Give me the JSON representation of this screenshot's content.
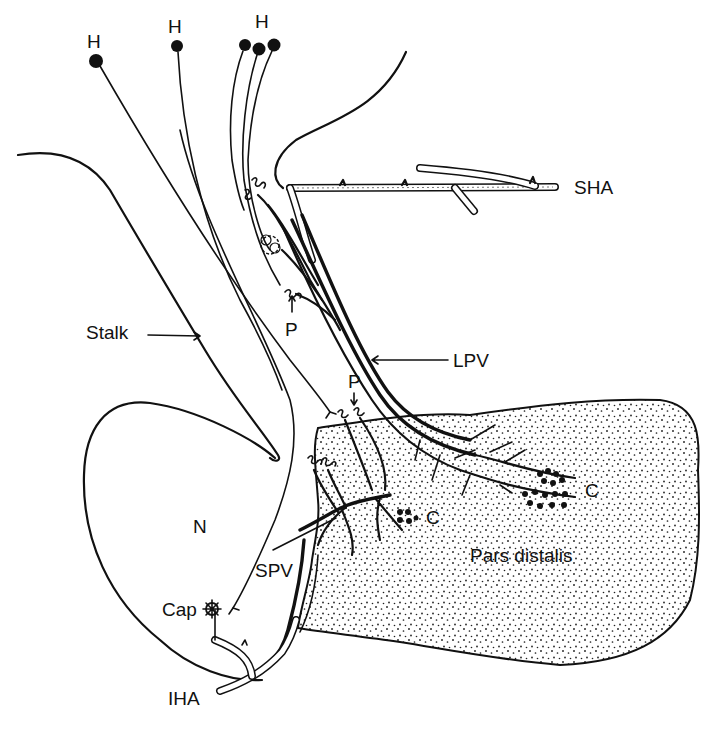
{
  "figure": {
    "labels": {
      "h_left": "H",
      "h_middle": "H",
      "h_right": "H",
      "sha": "SHA",
      "stalk": "Stalk",
      "p_upper": "P",
      "lpv": "LPV",
      "p_lower": "P",
      "n": "N",
      "c_left": "C",
      "c_right": "C",
      "spv": "SPV",
      "pars_distalis": "Pars distalis",
      "cap": "Cap",
      "iha": "IHA"
    },
    "colors": {
      "ink": "#111111",
      "background": "#ffffff",
      "stipple": "#222222"
    }
  }
}
